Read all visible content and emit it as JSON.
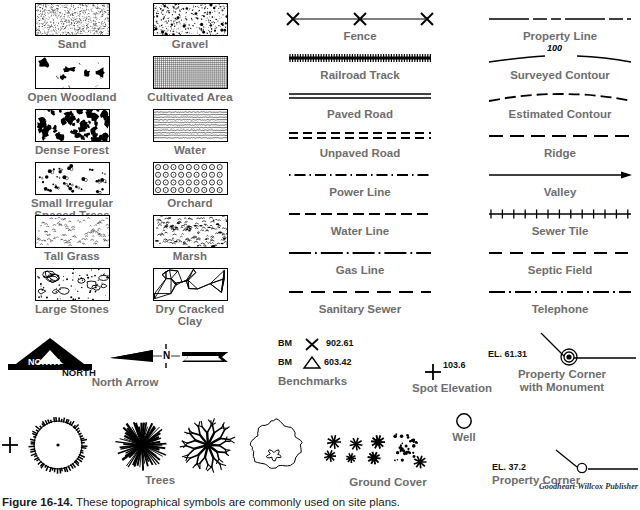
{
  "figure": {
    "caption_number": "Figure 16-14.",
    "caption_text": "These topographical symbols are commonly used on site plans.",
    "credit": "Goodheart-Willcox Publisher"
  },
  "hatch_symbols": [
    {
      "label": "Sand",
      "pattern": "sand",
      "col": 0,
      "row": 0
    },
    {
      "label": "Gravel",
      "pattern": "gravel",
      "col": 1,
      "row": 0
    },
    {
      "label": "Open Woodland",
      "pattern": "woodland",
      "col": 0,
      "row": 1
    },
    {
      "label": "Cultivated Area",
      "pattern": "cultivated",
      "col": 1,
      "row": 1
    },
    {
      "label": "Dense Forest",
      "pattern": "forest",
      "col": 0,
      "row": 2
    },
    {
      "label": "Water",
      "pattern": "water",
      "col": 1,
      "row": 2
    },
    {
      "label": "Small Irregular\nSpaced Trees",
      "pattern": "smalltrees",
      "col": 0,
      "row": 3
    },
    {
      "label": "Orchard",
      "pattern": "orchard",
      "col": 1,
      "row": 3
    },
    {
      "label": "Tall Grass",
      "pattern": "grass",
      "col": 0,
      "row": 4
    },
    {
      "label": "Marsh",
      "pattern": "marsh",
      "col": 1,
      "row": 4
    },
    {
      "label": "Large Stones",
      "pattern": "stones",
      "col": 0,
      "row": 5
    },
    {
      "label": "Dry Cracked\nClay",
      "pattern": "clay",
      "col": 1,
      "row": 5
    }
  ],
  "line_symbols": [
    {
      "label": "Fence",
      "style": "fence",
      "col": 0,
      "row": 0
    },
    {
      "label": "Railroad Track",
      "style": "railroad",
      "col": 0,
      "row": 1
    },
    {
      "label": "Paved Road",
      "style": "paved",
      "col": 0,
      "row": 2
    },
    {
      "label": "Unpaved Road",
      "style": "unpaved",
      "col": 0,
      "row": 3
    },
    {
      "label": "Power Line",
      "style": "power",
      "col": 0,
      "row": 4
    },
    {
      "label": "Water Line",
      "style": "waterline",
      "col": 0,
      "row": 5
    },
    {
      "label": "Gas Line",
      "style": "gasline",
      "col": 0,
      "row": 6
    },
    {
      "label": "Sanitary Sewer",
      "style": "sanitary",
      "col": 0,
      "row": 7
    },
    {
      "label": "Property Line",
      "style": "property",
      "col": 1,
      "row": 0
    },
    {
      "label": "Surveyed Contour",
      "style": "surveyed",
      "col": 1,
      "row": 1,
      "annotation": "100"
    },
    {
      "label": "Estimated Contour",
      "style": "estimated",
      "col": 1,
      "row": 2
    },
    {
      "label": "Ridge",
      "style": "ridge",
      "col": 1,
      "row": 3
    },
    {
      "label": "Valley",
      "style": "valley",
      "col": 1,
      "row": 4
    },
    {
      "label": "Sewer Tile",
      "style": "sewertile",
      "col": 1,
      "row": 5
    },
    {
      "label": "Septic Field",
      "style": "septic",
      "col": 1,
      "row": 6
    },
    {
      "label": "Telephone",
      "style": "telephone",
      "col": 1,
      "row": 7
    }
  ],
  "misc_symbols": {
    "north_arrow": {
      "label": "North Arrow",
      "arrow_text": "NORTH",
      "compass_letter": "N"
    },
    "benchmarks": {
      "label": "Benchmarks",
      "rows": [
        {
          "prefix": "BM",
          "marker": "cross",
          "value": "902.61"
        },
        {
          "prefix": "BM",
          "marker": "triangle",
          "value": "603.42"
        }
      ]
    },
    "spot_elevation": {
      "label": "Spot Elevation",
      "value": "103.6"
    },
    "property_corner_monument": {
      "label": "Property Corner\nwith Monument",
      "value": "EL. 61.31"
    },
    "trees": {
      "label": "Trees"
    },
    "ground_cover": {
      "label": "Ground Cover"
    },
    "well": {
      "label": "Well"
    },
    "property_corner": {
      "label": "Property Corner",
      "value": "EL. 37.2"
    }
  }
}
